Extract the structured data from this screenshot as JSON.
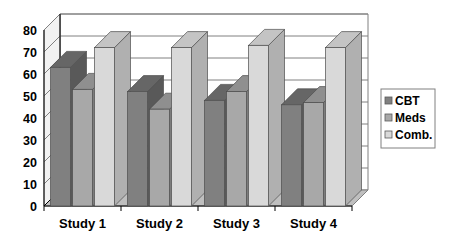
{
  "chart_data": {
    "type": "bar",
    "title": "",
    "subtitle": "",
    "xlabel": "",
    "ylabel": "",
    "categories": [
      "Study 1",
      "Study 2",
      "Study 3",
      "Study 4"
    ],
    "series": [
      {
        "name": "CBT",
        "color": "#808080",
        "values": [
          63,
          52,
          48,
          46
        ]
      },
      {
        "name": "Meds",
        "color": "#a8a8a8",
        "values": [
          53,
          44,
          52,
          47
        ]
      },
      {
        "name": "Comb.",
        "color": "#d9d9d9",
        "values": [
          72,
          72,
          73,
          72
        ]
      }
    ],
    "ylim": [
      0,
      80
    ],
    "ytick_step": 10,
    "yticks": [
      "0",
      "10",
      "20",
      "30",
      "40",
      "50",
      "60",
      "70",
      "80"
    ],
    "grid": true,
    "grid_axis": "y",
    "legend_position": "right",
    "style": "3d-column",
    "annotations": []
  },
  "legend": {
    "entries": [
      {
        "label": "CBT",
        "swatch_color": "#808080"
      },
      {
        "label": "Meds",
        "swatch_color": "#a8a8a8"
      },
      {
        "label": "Comb.",
        "swatch_color": "#d9d9d9"
      }
    ]
  },
  "colors": {
    "background": "#ffffff",
    "axis_line": "#000000",
    "grid_line": "#808080",
    "wall_back": "#ffffff",
    "wall_side": "#f2f2f2",
    "floor": "#bfbfbf",
    "series_cbt": "#808080",
    "series_cbt_top": "#666666",
    "series_cbt_side": "#595959",
    "series_meds": "#a8a8a8",
    "series_meds_top": "#8f8f8f",
    "series_meds_side": "#7d7d7d",
    "series_comb": "#d9d9d9",
    "series_comb_top": "#c4c4c4",
    "series_comb_side": "#b0b0b0",
    "legend_border": "#808080",
    "text": "#000000"
  }
}
